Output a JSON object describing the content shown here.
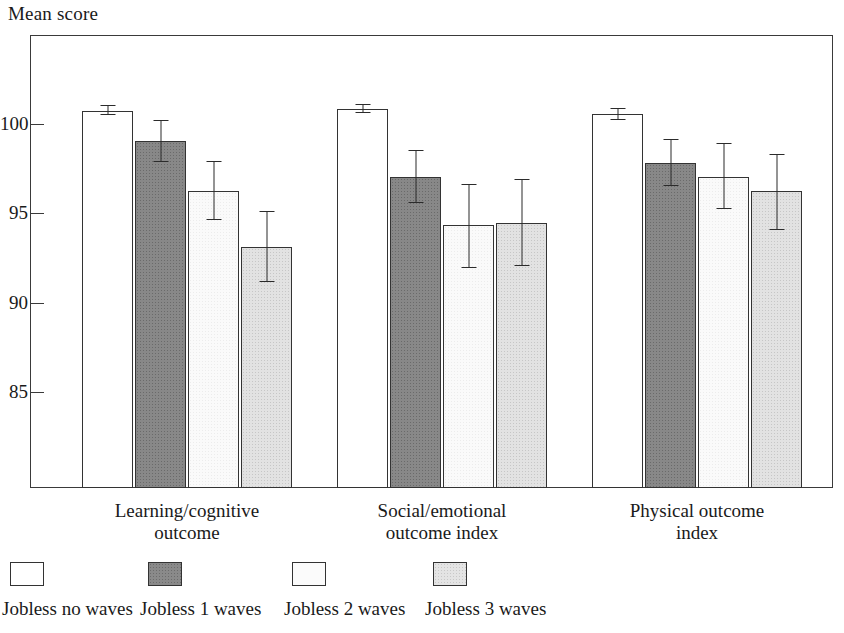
{
  "chart_data": {
    "type": "bar",
    "title": "",
    "ylabel": "Mean score",
    "xlabel": "",
    "ylim": [
      81.5,
      103.5
    ],
    "yticks": [
      100,
      95,
      90,
      85
    ],
    "ytick_labels": [
      "100",
      "95",
      "90",
      "85"
    ],
    "grid": false,
    "legend_position": "bottom",
    "error_bars": "95% confidence interval",
    "categories": [
      "Learning/cognitive\noutcome",
      "Social/emotional\noutcome index",
      "Physical outcome\nindex"
    ],
    "series": [
      {
        "name": "Jobless no waves",
        "fill": "white",
        "values": [
          100.8,
          100.9,
          100.6
        ],
        "err_low": [
          100.55,
          100.65,
          100.3
        ],
        "err_high": [
          101.1,
          101.2,
          100.95
        ]
      },
      {
        "name": "Jobless 1 waves",
        "fill": "dark",
        "values": [
          99.1,
          97.1,
          97.9
        ],
        "err_low": [
          97.95,
          95.65,
          96.6
        ],
        "err_high": [
          100.3,
          98.6,
          99.2
        ]
      },
      {
        "name": "Jobless 2 waves",
        "fill": "offwhite",
        "values": [
          96.3,
          94.4,
          97.1
        ],
        "err_low": [
          94.7,
          92.0,
          95.3
        ],
        "err_high": [
          98.0,
          96.7,
          99.0
        ]
      },
      {
        "name": "Jobless 3 waves",
        "fill": "light",
        "values": [
          93.2,
          94.5,
          96.3
        ],
        "err_low": [
          91.2,
          92.1,
          94.1
        ],
        "err_high": [
          95.2,
          97.0,
          98.4
        ]
      }
    ]
  },
  "legend": {
    "items": [
      {
        "label": "Jobless no waves",
        "fill": "white"
      },
      {
        "label": "Jobless 1 waves",
        "fill": "dark"
      },
      {
        "label": "Jobless 2 waves",
        "fill": "offwhite"
      },
      {
        "label": "Jobless 3 waves",
        "fill": "light"
      }
    ]
  },
  "colors": {
    "axis": "#3a3a3a",
    "bar_outline": "#333333",
    "error_bar": "#2b2b2b",
    "fill_white": "#ffffff",
    "fill_dark": "#888888",
    "fill_offwhite": "#fafafa",
    "fill_light": "#e2e2e2",
    "text": "#1a1a1a"
  }
}
